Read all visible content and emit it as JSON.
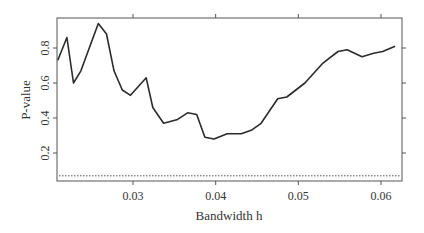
{
  "chart_data": {
    "type": "line",
    "title": "",
    "xlabel": "Bandwidth h",
    "ylabel": "P-value",
    "xlim": [
      0.0205,
      0.0625
    ],
    "ylim": [
      0.05,
      0.98
    ],
    "x_ticks": [
      "0.03",
      "0.04",
      "0.05",
      "0.06"
    ],
    "x_tick_values": [
      0.03,
      0.04,
      0.05,
      0.06
    ],
    "y_ticks": [
      "0.2",
      "0.4",
      "0.6",
      "0.8"
    ],
    "y_tick_values": [
      0.2,
      0.4,
      0.6,
      0.8
    ],
    "grid": false,
    "legend": null,
    "series": [
      {
        "name": "P-value",
        "style": "solid",
        "color": "#2b2b2b",
        "x": [
          0.0209,
          0.022,
          0.0228,
          0.0237,
          0.0258,
          0.0268,
          0.0277,
          0.0287,
          0.0297,
          0.0316,
          0.0324,
          0.0337,
          0.0353,
          0.0366,
          0.0377,
          0.0387,
          0.0398,
          0.0414,
          0.0431,
          0.0443,
          0.0455,
          0.0475,
          0.0486,
          0.0508,
          0.0529,
          0.0548,
          0.0559,
          0.0577,
          0.0591,
          0.0602,
          0.0617
        ],
        "values": [
          0.73,
          0.86,
          0.6,
          0.67,
          0.94,
          0.88,
          0.67,
          0.56,
          0.53,
          0.63,
          0.46,
          0.37,
          0.39,
          0.43,
          0.42,
          0.29,
          0.28,
          0.31,
          0.31,
          0.33,
          0.37,
          0.51,
          0.52,
          0.6,
          0.71,
          0.78,
          0.79,
          0.75,
          0.77,
          0.78,
          0.81
        ]
      },
      {
        "name": "significance level",
        "style": "dotted",
        "color": "#555555",
        "x": [
          0.0205,
          0.0625
        ],
        "values": [
          0.07,
          0.07
        ]
      }
    ]
  }
}
